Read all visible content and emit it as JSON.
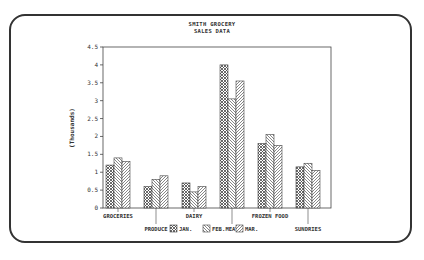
{
  "chart_data": {
    "type": "bar",
    "title": "SMITH GROCERY",
    "subtitle": "SALES DATA",
    "xlabel": "",
    "ylabel": "(Thousands)",
    "ylim": [
      0,
      4.5
    ],
    "yticks": [
      "0",
      "0.5",
      "1",
      "1.5",
      "2",
      "2.5",
      "3",
      "3.5",
      "4",
      "4.5"
    ],
    "categories": [
      "GROCERIES",
      "PRODUCE",
      "DAIRY",
      "MEAT",
      "FROZEN FOOD",
      "SUNDRIES"
    ],
    "series": [
      {
        "name": "JAN.",
        "values": [
          1.2,
          0.6,
          0.7,
          4.0,
          1.8,
          1.15
        ]
      },
      {
        "name": "FEB.",
        "values": [
          1.4,
          0.8,
          0.45,
          3.05,
          2.05,
          1.25
        ]
      },
      {
        "name": "MAR.",
        "values": [
          1.3,
          0.9,
          0.6,
          3.55,
          1.75,
          1.05
        ]
      }
    ],
    "grid": false,
    "legend_position": "bottom"
  },
  "colors": {
    "ink": "#333333",
    "background": "#ffffff"
  }
}
